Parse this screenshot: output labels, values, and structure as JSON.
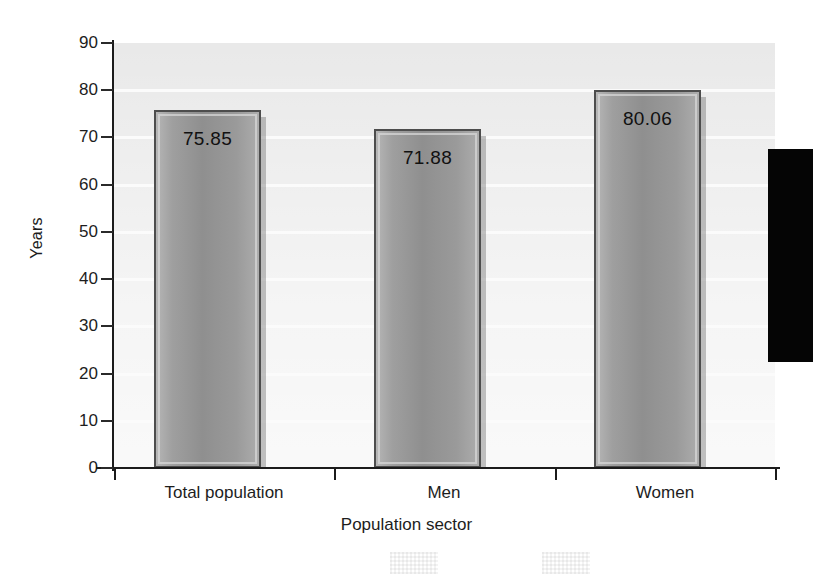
{
  "chart_data": {
    "type": "bar",
    "title": "",
    "subtitle": "",
    "categories": [
      "Total population",
      "Men",
      "Women"
    ],
    "values": [
      75.85,
      71.88,
      80.06
    ],
    "value_labels": [
      "75.85",
      "71.88",
      "80.06"
    ],
    "xlabel": "Population sector",
    "ylabel": "Years",
    "ylim": [
      0,
      90
    ],
    "ytick_step": 10,
    "yticks": [
      "90",
      "80",
      "70",
      "60",
      "50",
      "40",
      "30",
      "20",
      "10",
      "0"
    ],
    "ytick_values": [
      90,
      80,
      70,
      60,
      50,
      40,
      30,
      20,
      10,
      0
    ],
    "grid": "horizontal-white-gridlines",
    "legend": "none",
    "legend_position": "none",
    "series": [
      {
        "name": "Life expectancy",
        "values": [
          75.85,
          71.88,
          80.06
        ]
      }
    ],
    "colors": {
      "plot_background": "#e9e9e9",
      "gridline": "#fbfbfb",
      "bar_fill": "#9a9a9a",
      "bar_border": "#4d4d4d",
      "axis": "#1b1b1b",
      "text": "#1d1d1d",
      "page_background": "#ffffff",
      "artifact": "#050505"
    }
  },
  "artifacts": {
    "black_bar_name": "scan-artifact-black-bar",
    "halftone_name": "scan-artifact-halftone-patch"
  }
}
